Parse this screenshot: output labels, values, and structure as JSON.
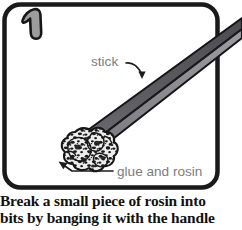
{
  "figure": {
    "step_number": "1",
    "caption_lines": [
      "Break a small piece of rosin into",
      "bits by banging it with the handle"
    ],
    "labels": {
      "stick": "stick",
      "glue_and_rosin": "glue and rosin"
    },
    "colors": {
      "panel_border": "#1a1a1a",
      "panel_background": "#ffffff",
      "stick_top_face": "#57565a",
      "stick_bottom_face": "#8d8d90",
      "stick_outline": "#16161a",
      "rosin_base": "#e8e8e8",
      "rosin_speckle": "#1c1c1c",
      "label_text": "#7a7a7a",
      "arrow": "#1a1a1a",
      "step_number_fill": "#9a9a9a",
      "step_number_outline": "#1a1a1a",
      "caption_text": "#111111"
    }
  }
}
